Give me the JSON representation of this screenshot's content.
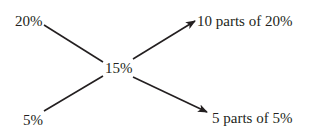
{
  "diagram": {
    "title": "",
    "colors": {
      "text": "#231f20",
      "line": "#231f20",
      "background": "#ffffff"
    },
    "nodes": {
      "top_left": "20%",
      "center": "15%",
      "bottom_left": "5%",
      "top_right": "10 parts of 20%",
      "bottom_right": "5 parts of 5%"
    },
    "edges": [
      {
        "from": "20%",
        "to": "15%",
        "style": "line"
      },
      {
        "from": "5%",
        "to": "15%",
        "style": "line"
      },
      {
        "from": "15%",
        "to": "10 parts of 20%",
        "style": "arrow"
      },
      {
        "from": "15%",
        "to": "5 parts of 5%",
        "style": "arrow"
      }
    ]
  }
}
